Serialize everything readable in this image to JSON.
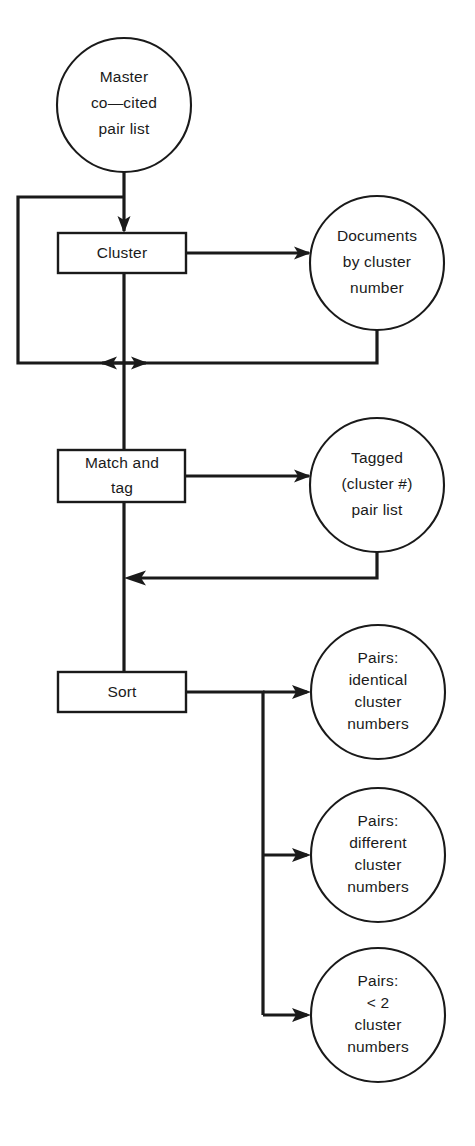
{
  "diagram": {
    "canvas": {
      "width": 475,
      "height": 1146
    },
    "colors": {
      "stroke": "#1a1a1a",
      "fill": "#ffffff",
      "background": "#ffffff"
    },
    "nodes": {
      "master_list": {
        "shape": "circle",
        "lines": [
          "Master",
          "co—cited",
          "pair  list"
        ]
      },
      "cluster_process": {
        "shape": "rectangle",
        "lines": [
          "Cluster"
        ]
      },
      "documents_by_cluster": {
        "shape": "circle",
        "lines": [
          "Documents",
          "by  cluster",
          "number"
        ]
      },
      "match_and_tag_process": {
        "shape": "rectangle",
        "lines": [
          "Match  and",
          "tag"
        ]
      },
      "tagged_pair_list": {
        "shape": "circle",
        "lines": [
          "Tagged",
          "(cluster  #)",
          "pair  list"
        ]
      },
      "sort_process": {
        "shape": "rectangle",
        "lines": [
          "Sort"
        ]
      },
      "pairs_identical": {
        "shape": "circle",
        "lines": [
          "Pairs:",
          "identical",
          "cluster",
          "numbers"
        ]
      },
      "pairs_different": {
        "shape": "circle",
        "lines": [
          "Pairs:",
          "different",
          "cluster",
          "numbers"
        ]
      },
      "pairs_fewer_than_two": {
        "shape": "circle",
        "lines": [
          "Pairs:",
          "<  2",
          "cluster",
          "numbers"
        ]
      }
    },
    "edges": [
      {
        "name": "master-to-cluster",
        "from": "master_list",
        "to": "cluster_process",
        "arrow": true
      },
      {
        "name": "cluster-to-documents",
        "from": "cluster_process",
        "to": "documents_by_cluster",
        "arrow": true
      },
      {
        "name": "cluster-feedback-left",
        "from": "cluster_process",
        "to": "trunk_junction",
        "arrow": true
      },
      {
        "name": "documents-return-right",
        "from": "documents_by_cluster",
        "to": "trunk_junction",
        "arrow": true
      },
      {
        "name": "trunk-to-match-and-tag",
        "from": "trunk_junction",
        "to": "match_and_tag_process",
        "arrow": false
      },
      {
        "name": "match-to-tagged",
        "from": "match_and_tag_process",
        "to": "tagged_pair_list",
        "arrow": true
      },
      {
        "name": "tagged-return",
        "from": "tagged_pair_list",
        "to": "sort_trunk",
        "arrow": true
      },
      {
        "name": "trunk-to-sort",
        "from": "sort_trunk",
        "to": "sort_process",
        "arrow": false
      },
      {
        "name": "sort-to-pairs-identical",
        "from": "sort_process",
        "to": "pairs_identical",
        "arrow": true
      },
      {
        "name": "sort-to-pairs-different",
        "from": "sort_process",
        "to": "pairs_different",
        "arrow": true
      },
      {
        "name": "sort-to-pairs-fewer-than-two",
        "from": "sort_process",
        "to": "pairs_fewer_than_two",
        "arrow": true
      }
    ]
  }
}
